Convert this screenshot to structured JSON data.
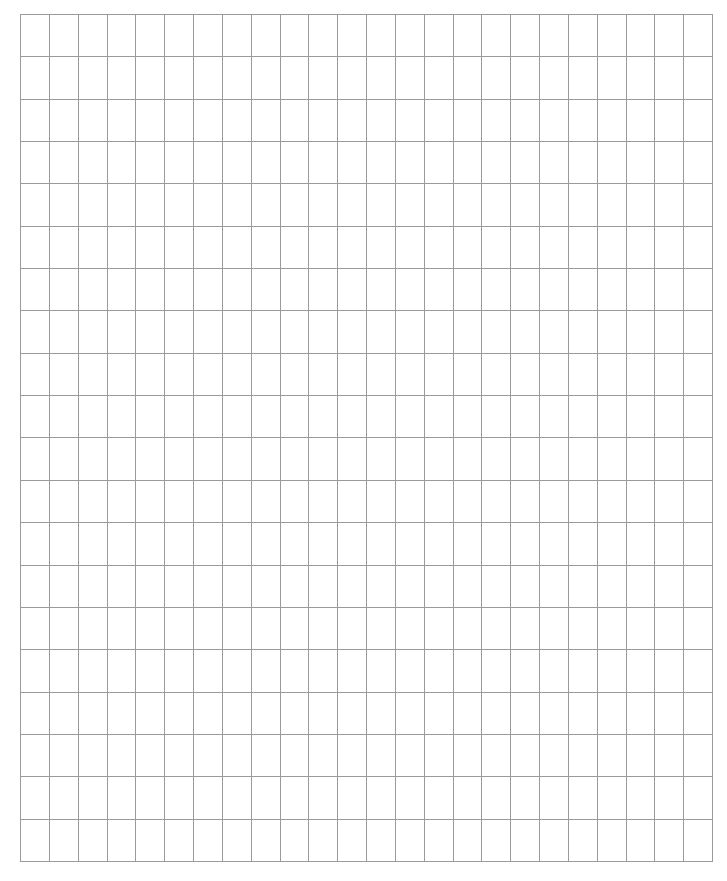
{
  "grid": {
    "columns": 24,
    "rows": 20,
    "line_color": "#9a9a9a",
    "background_color": "#ffffff",
    "cells": []
  }
}
